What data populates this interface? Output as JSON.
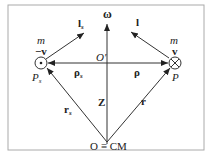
{
  "diagram": {
    "labels": {
      "omega": "ω",
      "l_s": "l",
      "l_s_sub": "s",
      "l": "l",
      "m_left": "m",
      "neg_v": "−v",
      "m_right": "m",
      "v": "v",
      "O_prime": "O′",
      "rho_s": "ρ",
      "rho_s_sub": "s",
      "rho": "ρ",
      "P_s": "P",
      "P_s_sub": "s",
      "P": "P",
      "r_s": "r",
      "r_s_sub": "s",
      "Z": "Z",
      "r": "r",
      "origin": "O ≡ CM"
    },
    "colors": {
      "line": "#333333",
      "frame": "#aaaaaa"
    }
  }
}
